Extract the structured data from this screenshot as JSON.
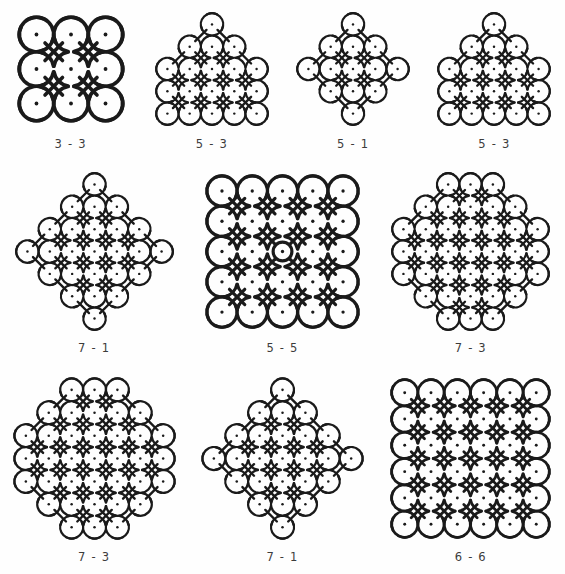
{
  "page": {
    "background_color": "#fefefe",
    "stroke_color": "#1a1a1a",
    "dot_color": "#1a1a1a",
    "label_color": "#3c3c3c"
  },
  "patterns": [
    {
      "id": "kolam-3-3",
      "label": "3 - 3",
      "rows_start": 3,
      "rows_end": 3,
      "shape": "square",
      "row_counts": [
        3,
        3,
        3
      ],
      "dot_count": 9,
      "cell": 42,
      "center_circle": false,
      "position": {
        "row": 0,
        "col": 0
      }
    },
    {
      "id": "kolam-5-3-a",
      "label": "5 - 3",
      "rows_start": 5,
      "rows_end": 3,
      "shape": "triangle-flat-bottom",
      "row_counts": [
        1,
        3,
        5,
        5,
        5
      ],
      "dot_count": 19,
      "cell": 26,
      "center_circle": false,
      "position": {
        "row": 0,
        "col": 1
      }
    },
    {
      "id": "kolam-5-1",
      "label": "5 - 1",
      "rows_start": 5,
      "rows_end": 1,
      "shape": "diamond",
      "row_counts": [
        1,
        3,
        5,
        3,
        1
      ],
      "dot_count": 13,
      "cell": 26,
      "center_circle": false,
      "position": {
        "row": 0,
        "col": 2
      }
    },
    {
      "id": "kolam-5-3-b",
      "label": "5 - 3",
      "rows_start": 5,
      "rows_end": 3,
      "shape": "triangle-flat-bottom",
      "row_counts": [
        1,
        3,
        5,
        5,
        5
      ],
      "dot_count": 19,
      "cell": 26,
      "center_circle": false,
      "position": {
        "row": 0,
        "col": 3
      }
    },
    {
      "id": "kolam-7-1",
      "label": "7 - 1",
      "rows_start": 7,
      "rows_end": 1,
      "shape": "plus-cross",
      "row_counts": [
        1,
        3,
        5,
        7,
        5,
        3,
        1
      ],
      "dot_count": 25,
      "cell": 23,
      "center_circle": false,
      "position": {
        "row": 1,
        "col": 0
      }
    },
    {
      "id": "kolam-5-5",
      "label": "5 - 5",
      "rows_start": 5,
      "rows_end": 5,
      "shape": "square",
      "row_counts": [
        5,
        5,
        5,
        5,
        5
      ],
      "dot_count": 25,
      "cell": 33,
      "center_circle": true,
      "position": {
        "row": 1,
        "col": 1
      }
    },
    {
      "id": "kolam-7-3-a",
      "label": "7 - 3",
      "rows_start": 7,
      "rows_end": 3,
      "shape": "hexagon",
      "row_counts": [
        3,
        5,
        7,
        7,
        7,
        5,
        3
      ],
      "dot_count": 37,
      "cell": 23,
      "center_circle": false,
      "position": {
        "row": 1,
        "col": 2
      }
    },
    {
      "id": "kolam-7-3-b",
      "label": "7 - 3",
      "rows_start": 7,
      "rows_end": 3,
      "shape": "hexagon",
      "row_counts": [
        3,
        5,
        7,
        7,
        7,
        5,
        3
      ],
      "dot_count": 37,
      "cell": 23,
      "center_circle": false,
      "position": {
        "row": 2,
        "col": 0
      }
    },
    {
      "id": "kolam-7-1-b",
      "label": "7 - 1",
      "rows_start": 7,
      "rows_end": 1,
      "shape": "diamond",
      "row_counts": [
        1,
        3,
        5,
        7,
        5,
        3,
        1
      ],
      "dot_count": 25,
      "cell": 23,
      "center_circle": false,
      "position": {
        "row": 2,
        "col": 1
      }
    },
    {
      "id": "kolam-6-6",
      "label": "6 - 6",
      "rows_start": 6,
      "rows_end": 6,
      "shape": "square",
      "row_counts": [
        6,
        6,
        6,
        6,
        6,
        6
      ],
      "dot_count": 36,
      "cell": 27,
      "center_circle": false,
      "position": {
        "row": 2,
        "col": 2
      }
    }
  ]
}
